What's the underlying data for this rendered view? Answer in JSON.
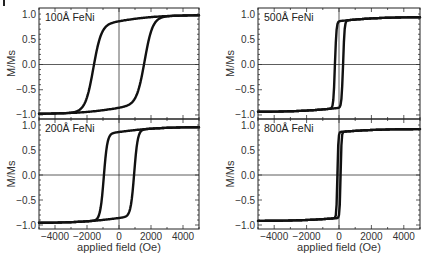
{
  "figure": {
    "corner_mark": "I"
  },
  "chart_data": [
    {
      "type": "line",
      "panel": "top-left",
      "label": "100Å FeNi",
      "xlabel": "",
      "ylabel": "M/Ms",
      "xlim": [
        -5000,
        5000
      ],
      "ylim": [
        -1.08,
        1.12
      ],
      "yticks": [
        "1.0",
        "0.5",
        "0.0",
        "-0.5",
        "-1.0"
      ],
      "ytick_values": [
        1.0,
        0.5,
        0.0,
        -0.5,
        -1.0
      ],
      "xticks": [],
      "coercive_field_Oe": 1600,
      "loop_width": 500,
      "saturation_tail": 0.12,
      "series": [
        {
          "name": "descending branch",
          "x": [
            5000,
            2000,
            0,
            -1000,
            -1600,
            -2500,
            -5000
          ],
          "y": [
            0.95,
            0.9,
            0.85,
            0.6,
            0.0,
            -0.6,
            -0.85
          ]
        },
        {
          "name": "ascending branch",
          "x": [
            -5000,
            -2000,
            0,
            1000,
            1600,
            2500,
            5000
          ],
          "y": [
            -0.95,
            -0.9,
            -0.85,
            -0.6,
            0.0,
            0.6,
            0.85
          ]
        }
      ]
    },
    {
      "type": "line",
      "panel": "bottom-left",
      "label": "200Å FeNi",
      "xlabel": "applied field (Oe)",
      "ylabel": "M/Ms",
      "xlim": [
        -5000,
        5000
      ],
      "ylim": [
        -1.08,
        1.12
      ],
      "yticks": [
        "1.0",
        "0.5",
        "0.0",
        "-0.5",
        "-1.0"
      ],
      "ytick_values": [
        1.0,
        0.5,
        0.0,
        -0.5,
        -1.0
      ],
      "xticks": [
        "-4000",
        "-2000",
        "0",
        "2000",
        "4000"
      ],
      "xtick_values": [
        -4000,
        -2000,
        0,
        2000,
        4000
      ],
      "coercive_field_Oe": 950,
      "loop_width": 220,
      "saturation_tail": 0.1,
      "series": [
        {
          "name": "descending branch",
          "x": [
            5000,
            1000,
            0,
            -700,
            -950,
            -1500,
            -5000
          ],
          "y": [
            0.97,
            0.92,
            0.9,
            0.8,
            0.0,
            -0.7,
            -0.85
          ]
        },
        {
          "name": "ascending branch",
          "x": [
            -5000,
            -1000,
            0,
            700,
            950,
            1500,
            5000
          ],
          "y": [
            -0.97,
            -0.92,
            -0.9,
            -0.8,
            0.0,
            0.7,
            0.85
          ]
        }
      ]
    },
    {
      "type": "line",
      "panel": "top-right",
      "label": "500Å FeNi",
      "xlabel": "",
      "ylabel": "M/Ms",
      "xlim": [
        -5000,
        5000
      ],
      "ylim": [
        -1.08,
        1.12
      ],
      "yticks": [
        "1.0",
        "0.5",
        "0.0",
        "-0.5",
        "-1.0"
      ],
      "ytick_values": [
        1.0,
        0.5,
        0.0,
        -0.5,
        -1.0
      ],
      "xticks": [],
      "coercive_field_Oe": 250,
      "loop_width": 90,
      "saturation_tail": 0.08,
      "series": [
        {
          "name": "descending branch",
          "x": [
            5000,
            200,
            0,
            -150,
            -250,
            -800,
            -5000
          ],
          "y": [
            0.95,
            0.88,
            0.85,
            0.5,
            0.0,
            -0.6,
            -0.8
          ]
        },
        {
          "name": "ascending branch",
          "x": [
            -5000,
            -200,
            0,
            150,
            250,
            800,
            5000
          ],
          "y": [
            -0.95,
            -0.88,
            -0.85,
            -0.5,
            0.0,
            0.6,
            0.8
          ]
        }
      ]
    },
    {
      "type": "line",
      "panel": "bottom-right",
      "label": "800Å FeNi",
      "xlabel": "applied field (Oe)",
      "ylabel": "M/Ms",
      "xlim": [
        -5000,
        5000
      ],
      "ylim": [
        -1.08,
        1.12
      ],
      "yticks": [
        "1.0",
        "0.5",
        "0.0",
        "-0.5",
        "-1.0"
      ],
      "ytick_values": [
        1.0,
        0.5,
        0.0,
        -0.5,
        -1.0
      ],
      "xticks": [
        "-4000",
        "-2000",
        "0",
        "2000",
        "4000"
      ],
      "xtick_values": [
        -4000,
        -2000,
        0,
        2000,
        4000
      ],
      "coercive_field_Oe": 100,
      "loop_width": 60,
      "saturation_tail": 0.06,
      "series": [
        {
          "name": "descending branch",
          "x": [
            5000,
            100,
            0,
            -100,
            -500,
            -5000
          ],
          "y": [
            0.97,
            0.93,
            0.9,
            0.0,
            -0.6,
            -0.95
          ]
        },
        {
          "name": "ascending branch",
          "x": [
            -5000,
            -100,
            0,
            100,
            500,
            5000
          ],
          "y": [
            -0.97,
            -0.93,
            -0.9,
            0.0,
            0.6,
            0.95
          ]
        }
      ]
    }
  ]
}
